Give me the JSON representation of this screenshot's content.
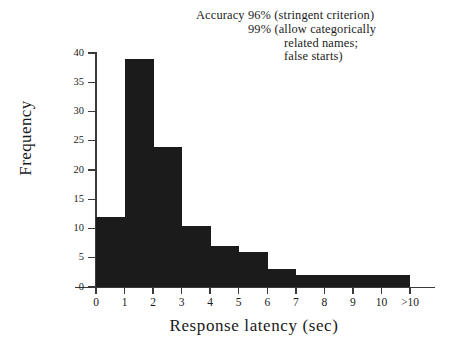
{
  "figure": {
    "background_color": "#ffffff",
    "ink_color": "#1b1b1b",
    "axis_color": "#3a3a3a"
  },
  "annotation": {
    "line1": "Accuracy  96%  (stringent criterion)",
    "line2": "99%  (allow categorically",
    "line3": "related  names;",
    "line4": "false  starts)"
  },
  "chart_data": {
    "type": "bar",
    "title": "",
    "subtitle": "",
    "xlabel": "Response  latency  (sec)",
    "ylabel": "Frequency",
    "categories": [
      "0-1",
      "1-2",
      "2-3",
      "3-4",
      "4-5",
      "5-6",
      "6-7",
      "7-8",
      "8-9",
      "9-10",
      ">10"
    ],
    "values": [
      12,
      39,
      24,
      10.5,
      7,
      6,
      3,
      2,
      2,
      2,
      2
    ],
    "xtick_labels": [
      "0",
      "1",
      "2",
      "3",
      "4",
      "5",
      "6",
      "7",
      "8",
      "9",
      "10",
      ">10"
    ],
    "ytick_labels": [
      "0",
      "5",
      "10",
      "15",
      "20",
      "25",
      "30",
      "35",
      "40"
    ],
    "ytick_values": [
      0,
      5,
      10,
      15,
      20,
      25,
      30,
      35,
      40
    ],
    "ylim": [
      0,
      40
    ],
    "xlim": [
      0,
      11
    ],
    "grid": false,
    "legend": "none",
    "bar_color": "#1b1b1b",
    "annotation_text": "Accuracy 96% (stringent criterion) 99% (allow categorically related names; false starts)"
  }
}
